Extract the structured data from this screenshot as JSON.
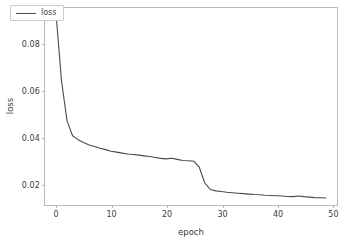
{
  "chart_data": {
    "type": "line",
    "title": "",
    "xlabel": "epoch",
    "ylabel": "loss",
    "xlim": [
      -2.0,
      51.0
    ],
    "ylim": [
      0.0105,
      0.0955
    ],
    "xticks": [
      0,
      10,
      20,
      30,
      40,
      50
    ],
    "xticklabels": [
      "0",
      "10",
      "20",
      "30",
      "40",
      "50"
    ],
    "yticks": [
      0.02,
      0.04,
      0.06,
      0.08
    ],
    "yticklabels": [
      "0.02",
      "0.04",
      "0.06",
      "0.08"
    ],
    "grid": false,
    "legend": {
      "position": "upper left",
      "entries": [
        {
          "name": "loss",
          "color": "#4a4a4a"
        }
      ]
    },
    "series": [
      {
        "name": "loss",
        "color": "#4a4a4a",
        "linewidth": 1.1,
        "x": [
          0,
          1,
          2,
          3,
          4,
          5,
          6,
          7,
          8,
          9,
          10,
          11,
          12,
          13,
          14,
          15,
          16,
          17,
          18,
          19,
          20,
          21,
          22,
          23,
          24,
          25,
          26,
          27,
          28,
          29,
          30,
          31,
          32,
          33,
          34,
          35,
          36,
          37,
          38,
          39,
          40,
          41,
          42,
          43,
          44,
          45,
          46,
          47,
          48,
          49
        ],
        "values": [
          0.093,
          0.064,
          0.0468,
          0.0404,
          0.0387,
          0.0375,
          0.0364,
          0.0357,
          0.035,
          0.0344,
          0.0337,
          0.0333,
          0.0329,
          0.0325,
          0.0323,
          0.032,
          0.0317,
          0.0314,
          0.031,
          0.0306,
          0.0304,
          0.0307,
          0.0302,
          0.0297,
          0.0296,
          0.0294,
          0.0268,
          0.02,
          0.0172,
          0.0166,
          0.0163,
          0.016,
          0.0158,
          0.0156,
          0.0154,
          0.0152,
          0.015,
          0.0149,
          0.0147,
          0.0146,
          0.0145,
          0.0144,
          0.0142,
          0.0141,
          0.0144,
          0.0141,
          0.0139,
          0.0137,
          0.0136,
          0.0135
        ]
      }
    ],
    "style": {
      "background": "#ffffff",
      "spine_color": "#b8b8b8",
      "tick_color": "#b0b0b0",
      "text_color": "#3c3c3c"
    }
  }
}
